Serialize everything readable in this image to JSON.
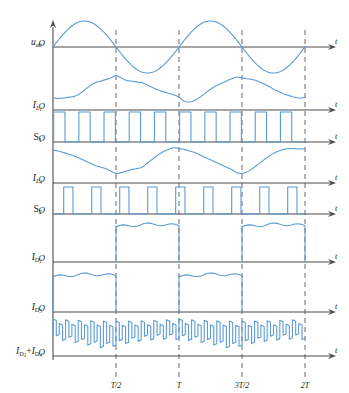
{
  "figure": {
    "type": "waveform-timing-diagram",
    "background": "#ffffff",
    "trace_color": "#5b9bd5",
    "axis_color": "#4d4d4d",
    "dash_color": "#4d4d4d",
    "origin_label": "O",
    "time_axis_label": "t"
  },
  "x_ticks": [
    {
      "label": "T/2",
      "x": 0.5
    },
    {
      "label": "T",
      "x": 1.0
    },
    {
      "label": "3T/2",
      "x": 1.5
    },
    {
      "label": "2T",
      "x": 2.0
    }
  ],
  "rows": [
    {
      "id": "uab",
      "label_main": "u",
      "label_sub": "ab",
      "label_sub2": "",
      "kind": "sine-bipolar"
    },
    {
      "id": "il1",
      "label_main": "I",
      "label_sub": "L",
      "label_sub2": "1",
      "kind": "ripple-positive"
    },
    {
      "id": "s1",
      "label_main": "S",
      "label_sub": "1",
      "label_sub2": "",
      "kind": "pwm"
    },
    {
      "id": "il4",
      "label_main": "I",
      "label_sub": "L",
      "label_sub2": "4",
      "kind": "ripple-positive-inverted"
    },
    {
      "id": "s2",
      "label_main": "S",
      "label_sub": "2",
      "label_sub2": "",
      "kind": "pwm"
    },
    {
      "id": "id1",
      "label_main": "I",
      "label_sub": "D",
      "label_sub2": "1",
      "kind": "gated-plateau-second-half"
    },
    {
      "id": "id3",
      "label_main": "I",
      "label_sub": "D",
      "label_sub2": "3",
      "kind": "gated-plateau-first-half"
    },
    {
      "id": "id1_id4",
      "label_main": "I",
      "label_sub": "D",
      "label_sub2": "1",
      "kind": "sum-ripple",
      "label_extra_main": "I",
      "label_extra_sub": "D",
      "label_extra_sub2": "4",
      "label_join": "+"
    }
  ],
  "chart_data": {
    "type": "line",
    "title": "",
    "xlabel": "t",
    "ylabel": "",
    "xlim": [
      0,
      2.12
    ],
    "grid": false,
    "legend": "none",
    "xticks": [
      0.5,
      1.0,
      1.5,
      2.0
    ],
    "xticklabels": [
      "T/2",
      "T",
      "3T/2",
      "2T"
    ],
    "series": [
      {
        "name": "u_ab",
        "type": "sine",
        "description": "Bipolar sinusoid, two full cycles over 0..2T, zero crossings at 0, T/2, T, 3T/2, 2T",
        "amplitude": 1.0,
        "cycles": 2,
        "phase": 0,
        "baseline": 0
      },
      {
        "name": "I_L1",
        "type": "ripple-positive",
        "description": "All-positive wavy current, local peak near T/2 and 3T/2, minimum near T",
        "min": 0.18,
        "max": 0.86,
        "values": [
          0.3,
          0.29,
          0.3,
          0.32,
          0.34,
          0.4,
          0.5,
          0.6,
          0.68,
          0.72,
          0.76,
          0.8,
          0.86,
          0.8,
          0.74,
          0.72,
          0.7,
          0.68,
          0.62,
          0.56,
          0.5,
          0.46,
          0.42,
          0.38,
          0.32,
          0.22,
          0.2,
          0.24,
          0.32,
          0.42,
          0.52,
          0.6,
          0.66,
          0.72,
          0.78,
          0.82,
          0.8,
          0.78,
          0.76,
          0.72,
          0.66,
          0.6,
          0.52,
          0.46,
          0.4,
          0.36,
          0.32,
          0.3,
          0.31
        ]
      },
      {
        "name": "S1",
        "type": "pwm",
        "description": "Gate pulses, ten wide pulses over 0..2T, duty approx 0.45",
        "high": 1.0,
        "low": 0.0,
        "pulse_count": 10,
        "duty": 0.45
      },
      {
        "name": "I_L4",
        "type": "ripple-positive-inverted",
        "description": "All-positive wavy current in antiphase with I_L1, minima near T/2 and 3T/2, peak near T",
        "min": 0.22,
        "max": 0.88,
        "values": [
          0.82,
          0.8,
          0.76,
          0.72,
          0.68,
          0.62,
          0.56,
          0.5,
          0.44,
          0.4,
          0.36,
          0.3,
          0.24,
          0.26,
          0.3,
          0.34,
          0.36,
          0.4,
          0.5,
          0.6,
          0.7,
          0.78,
          0.84,
          0.88,
          0.86,
          0.84,
          0.8,
          0.76,
          0.7,
          0.64,
          0.58,
          0.52,
          0.46,
          0.4,
          0.34,
          0.26,
          0.24,
          0.28,
          0.36,
          0.46,
          0.56,
          0.66,
          0.74,
          0.8,
          0.84,
          0.86,
          0.86,
          0.85,
          0.86
        ]
      },
      {
        "name": "S2",
        "type": "pwm",
        "description": "Gate pulses interleaved with S1, nine narrow pulses over 0..2T, duty approx 0.33",
        "high": 1.0,
        "low": 0.0,
        "pulse_count": 9,
        "duty": 0.33
      },
      {
        "name": "I_D1",
        "type": "gated-plateau",
        "description": "Zero on 0..T/2 and T..3T/2; rippled plateau on T/2..T and 3T/2..2T",
        "plateau_level": 0.82,
        "ripple": 0.07,
        "active_intervals": [
          [
            0.5,
            1.0
          ],
          [
            1.5,
            2.0
          ]
        ]
      },
      {
        "name": "I_D3",
        "type": "gated-plateau",
        "description": "Rippled plateau on 0..T/2 and T..3T/2; zero on T/2..T and 3T/2..2T",
        "plateau_level": 0.82,
        "ripple": 0.07,
        "active_intervals": [
          [
            0.0,
            0.5
          ],
          [
            1.0,
            1.5
          ]
        ]
      },
      {
        "name": "I_D1+I_D4",
        "type": "sum-ripple",
        "description": "Continuous high-frequency chopped sum current, alternating high and low steps, never zero",
        "high": 0.88,
        "low": 0.18,
        "step_count": 40
      }
    ]
  }
}
